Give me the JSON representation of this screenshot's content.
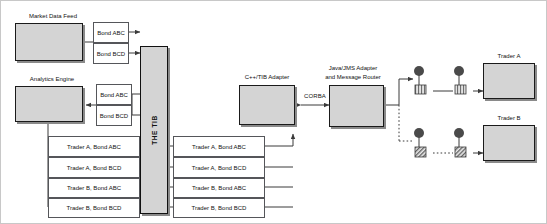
{
  "diagram": {
    "colors": {
      "box_fill": "#d4d4d4",
      "box_border": "#1a1a1a",
      "msg_border": "#55565a",
      "line": "#3a3a3a",
      "node_icon": "#4a4a4a",
      "background": "#ffffff"
    },
    "sources": [
      {
        "id": "market-data-feed",
        "label": "Market Data Feed"
      },
      {
        "id": "analytics-engine",
        "label": "Analytics Engine"
      }
    ],
    "feed_messages": [
      {
        "label": "Bond ABC"
      },
      {
        "label": "Bond BCD"
      }
    ],
    "analytics_messages": [
      {
        "label": "Bond ABC"
      },
      {
        "label": "Bond BCD"
      }
    ],
    "bus": {
      "label": "THE TIB"
    },
    "trader_messages_left": [
      {
        "label": "Trader A, Bond ABC"
      },
      {
        "label": "Trader A, Bond BCD"
      },
      {
        "label": "Trader B, Bond ABC"
      },
      {
        "label": "Trader B, Bond BCD"
      }
    ],
    "trader_messages_right": [
      {
        "label": "Trader A, Bond ABC"
      },
      {
        "label": "Trader A, Bond BCD"
      },
      {
        "label": "Trader B, Bond ABC"
      },
      {
        "label": "Trader B, Bond BCD"
      }
    ],
    "adapters": [
      {
        "id": "cpp-tib-adapter",
        "label": "C++/TIB Adapter"
      },
      {
        "id": "java-jms-adapter",
        "label_line1": "Java/JMS Adapter",
        "label_line2": "and Message Router"
      }
    ],
    "protocol_link": {
      "label": "CORBA"
    },
    "traders": [
      {
        "id": "trader-a",
        "label": "Trader A",
        "style": "solid"
      },
      {
        "id": "trader-b",
        "label": "Trader B",
        "style": "dashed"
      }
    ],
    "relay_icons": [
      {
        "row": "trader-a",
        "index": 1,
        "fill": "striped-vertical"
      },
      {
        "row": "trader-a",
        "index": 2,
        "fill": "striped-vertical"
      },
      {
        "row": "trader-b",
        "index": 1,
        "fill": "striped-diagonal"
      },
      {
        "row": "trader-b",
        "index": 2,
        "fill": "striped-diagonal"
      }
    ]
  }
}
